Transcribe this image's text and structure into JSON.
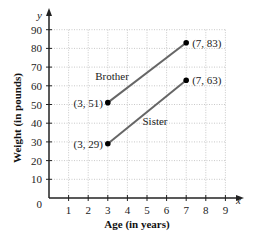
{
  "chart_data": {
    "type": "line",
    "title": "",
    "xlabel": "Age (in years)",
    "ylabel": "Weight (in pounds)",
    "x_axis_var": "x",
    "y_axis_var": "y",
    "xlim": [
      0,
      9
    ],
    "ylim": [
      0,
      90
    ],
    "x_ticks": [
      1,
      2,
      3,
      4,
      5,
      6,
      7,
      8,
      9
    ],
    "y_ticks": [
      10,
      20,
      30,
      40,
      50,
      60,
      70,
      80,
      90
    ],
    "origin_label": "0",
    "grid": true,
    "series": [
      {
        "name": "Brother",
        "points": [
          [
            3,
            51
          ],
          [
            7,
            83
          ]
        ],
        "point_labels": [
          "(3, 51)",
          "(7, 83)"
        ]
      },
      {
        "name": "Sister",
        "points": [
          [
            3,
            29
          ],
          [
            7,
            63
          ]
        ],
        "point_labels": [
          "(3, 29)",
          "(7, 63)"
        ]
      }
    ],
    "line_color": "#666666",
    "point_color": "#000000"
  }
}
